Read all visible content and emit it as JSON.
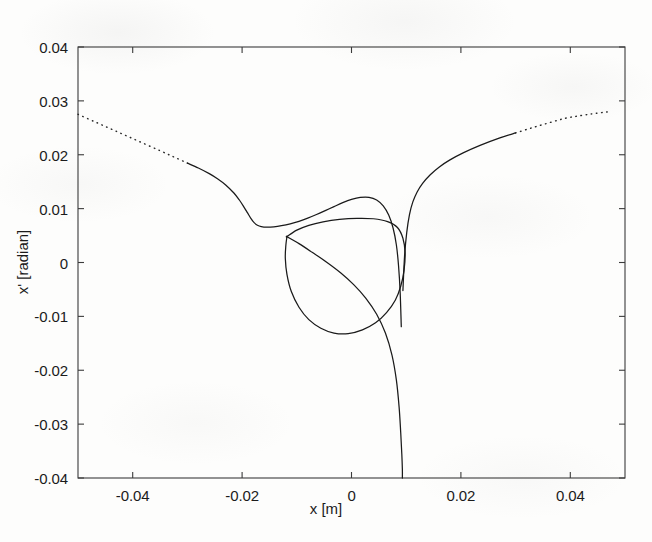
{
  "figure": {
    "kind": "phase-space-plot",
    "background_color": "#fdfdfc",
    "curve_color": "#1a1a1a",
    "axis_color": "#3b3b3b"
  },
  "chart_data": {
    "type": "line",
    "title": "",
    "subtitle": "",
    "xlabel": "x [m]",
    "ylabel": "x' [radian]",
    "xlim": [
      -0.05,
      0.05
    ],
    "ylim": [
      -0.04,
      0.04
    ],
    "xticks": [
      -0.04,
      -0.02,
      0,
      0.02,
      0.04
    ],
    "xtick_labels": [
      "-0.04",
      "-0.02",
      "0",
      "0.02",
      "0.04"
    ],
    "yticks": [
      0.04,
      0.03,
      0.02,
      0.01,
      0,
      -0.01,
      -0.02,
      -0.03,
      -0.04
    ],
    "ytick_labels": [
      "0.04",
      "0.03",
      "0.02",
      "0.01",
      "0",
      "-0.01",
      "-0.02",
      "-0.03",
      "-0.04"
    ],
    "grid": false,
    "legend": null,
    "legend_position": "none",
    "annotations": [],
    "series": [
      {
        "name": "separatrix-upper-left-branch",
        "style": "dotted",
        "comment": "incoming asymptotic branch entering from upper-left edge of frame",
        "x": [
          -0.05,
          -0.047,
          -0.044,
          -0.041,
          -0.038,
          -0.035,
          -0.0325,
          -0.03
        ],
        "y": [
          0.0275,
          0.02615,
          0.0248,
          0.02345,
          0.0221,
          0.02075,
          0.0196,
          0.01845
        ]
      },
      {
        "name": "separatrix-upper-left-branch-solid",
        "style": "solid",
        "comment": "continuation of the upper-left branch sweeping down to the left vertex of the triangular island",
        "x": [
          -0.03,
          -0.028,
          -0.026,
          -0.0245,
          -0.023,
          -0.0215,
          -0.0205,
          -0.0196,
          -0.019,
          -0.0184,
          -0.0178,
          -0.0172,
          -0.0165,
          -0.0155,
          -0.0142,
          -0.0128,
          -0.0112,
          -0.0096,
          -0.008,
          -0.0064,
          -0.0048,
          -0.0032,
          -0.0016,
          0.0,
          0.0016,
          0.0032,
          0.0046,
          0.0058,
          0.0068,
          0.0076,
          0.0082,
          0.0086,
          0.0089,
          0.0091
        ],
        "y": [
          0.01845,
          0.01755,
          0.0165,
          0.01555,
          0.0144,
          0.0129,
          0.0116,
          0.0102,
          0.0092,
          0.0082,
          0.0074,
          0.00692,
          0.00666,
          0.00655,
          0.00662,
          0.00683,
          0.00718,
          0.00765,
          0.00823,
          0.0089,
          0.00963,
          0.01038,
          0.0111,
          0.0117,
          0.01208,
          0.0121,
          0.0116,
          0.0105,
          0.0088,
          0.0064,
          0.0033,
          -0.0006,
          -0.0056,
          -0.0119
        ]
      },
      {
        "name": "separatrix-upper-right-branch",
        "style": "solid",
        "comment": "outgoing branch climbing from the cusp toward the upper-right",
        "x": [
          0.0094,
          0.0097,
          0.0101,
          0.0106,
          0.0112,
          0.012,
          0.013,
          0.0144,
          0.016,
          0.018,
          0.0205,
          0.0235,
          0.027,
          0.03
        ],
        "y": [
          -0.0052,
          0.0012,
          0.0056,
          0.0089,
          0.0112,
          0.0131,
          0.0147,
          0.0163,
          0.0177,
          0.01905,
          0.0204,
          0.02175,
          0.0231,
          0.02405
        ]
      },
      {
        "name": "separatrix-upper-right-branch-dotted",
        "style": "dotted",
        "comment": "asymptotic dotted continuation toward the right frame edge",
        "x": [
          0.03,
          0.033,
          0.036,
          0.039,
          0.0415,
          0.044,
          0.046,
          0.0472
        ],
        "y": [
          0.02405,
          0.025,
          0.0259,
          0.02675,
          0.0272,
          0.0276,
          0.02785,
          0.028
        ]
      },
      {
        "name": "island-triangular-loop",
        "style": "solid",
        "comment": "closed triangular resonance island (third-order resonance separatrix)",
        "x": [
          -0.0118,
          -0.01,
          -0.0078,
          -0.0052,
          -0.0022,
          0.001,
          0.004,
          0.0066,
          0.0084,
          0.0094,
          0.0098,
          0.0096,
          0.009,
          0.008,
          0.0064,
          0.0044,
          0.002,
          -0.0006,
          -0.0032,
          -0.0056,
          -0.0078,
          -0.0096,
          -0.011,
          -0.0118,
          -0.0121,
          -0.012,
          -0.0118
        ],
        "y": [
          0.0048,
          0.006,
          0.0069,
          0.00755,
          0.008,
          0.0082,
          0.00812,
          0.0076,
          0.0065,
          0.0045,
          0.0018,
          -0.0015,
          -0.0044,
          -0.007,
          -0.0093,
          -0.0112,
          -0.0125,
          -0.0132,
          -0.0131,
          -0.0122,
          -0.0106,
          -0.0083,
          -0.0054,
          -0.0022,
          0.0008,
          0.0032,
          0.0048
        ]
      },
      {
        "name": "separatrix-lower-descending-branch",
        "style": "solid",
        "comment": "branch plunging from the island lower-right region straight down to the bottom frame edge near x = 0.009",
        "x": [
          -0.0118,
          -0.0096,
          -0.0072,
          -0.0046,
          -0.002,
          0.0004,
          0.0026,
          0.0046,
          0.0062,
          0.0074,
          0.0082,
          0.0087,
          0.009,
          0.0092,
          0.0093,
          0.0093
        ],
        "y": [
          0.0048,
          0.0035,
          0.0019,
          0.0001,
          -0.0019,
          -0.0041,
          -0.0066,
          -0.0096,
          -0.0131,
          -0.0172,
          -0.0218,
          -0.0268,
          -0.0316,
          -0.0356,
          -0.0384,
          -0.04
        ]
      }
    ]
  }
}
